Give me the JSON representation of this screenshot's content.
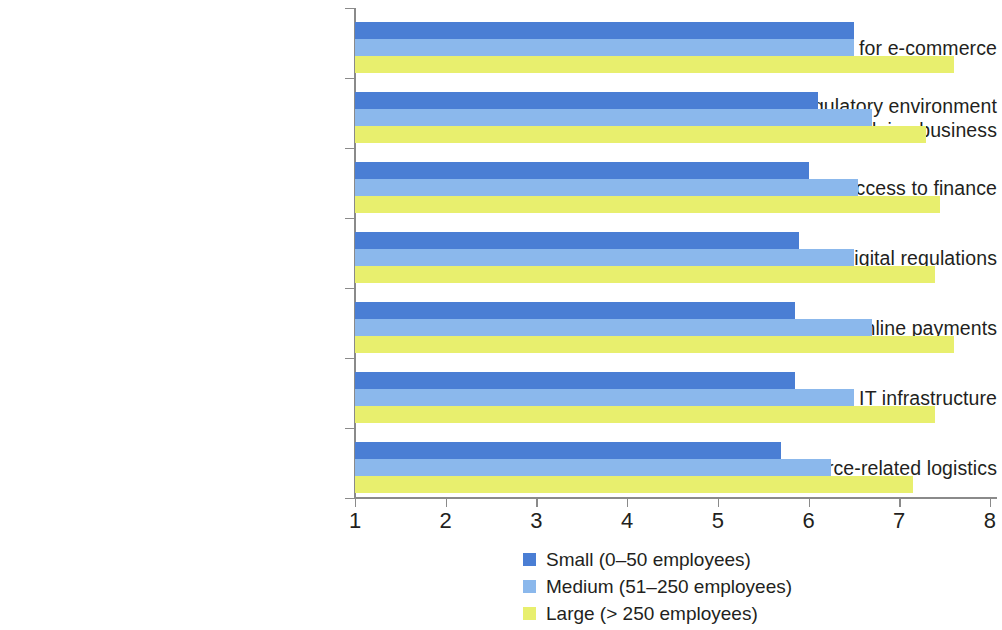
{
  "chart_data": {
    "type": "bar",
    "orientation": "horizontal",
    "title": "",
    "subtitle": "",
    "xlabel": "",
    "ylabel": "",
    "xlim": [
      1,
      8
    ],
    "xticks": [
      "1",
      "2",
      "3",
      "4",
      "5",
      "6",
      "7",
      "8"
    ],
    "grid": false,
    "legend_position": "bottom",
    "categories": [
      "My team’s capacity for e-commerce",
      "Overall regulatory environment\nfor doing business",
      "Access to finance",
      "E-commerce and digital regulations",
      "Online payments",
      "Connectivity and IT infrastructure",
      "E-commerce-related logistics"
    ],
    "series": [
      {
        "name": "Small (0–50 employees)",
        "color": "#4a7ed4",
        "values": [
          6.5,
          6.1,
          6.0,
          5.9,
          5.85,
          5.85,
          5.7
        ]
      },
      {
        "name": "Medium (51–250 employees)",
        "color": "#8bb8ec",
        "values": [
          6.5,
          6.7,
          6.55,
          6.5,
          6.7,
          6.5,
          6.25
        ]
      },
      {
        "name": "Large (> 250 employees)",
        "color": "#e8ef6e",
        "values": [
          7.6,
          7.3,
          7.45,
          7.4,
          7.6,
          7.4,
          7.15
        ]
      }
    ]
  },
  "legend": {
    "items": [
      {
        "label": "Small (0–50 employees)",
        "color": "#4a7ed4"
      },
      {
        "label": "Medium (51–250 employees)",
        "color": "#8bb8ec"
      },
      {
        "label": "Large (> 250 employees)",
        "color": "#e8ef6e"
      }
    ]
  }
}
